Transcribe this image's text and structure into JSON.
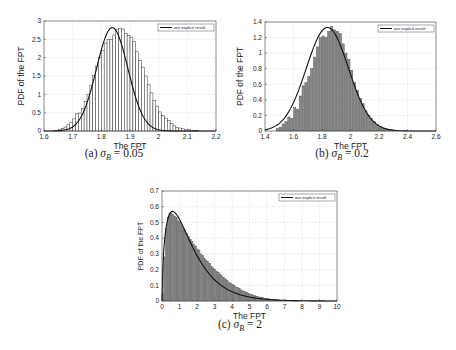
{
  "chart_data": [
    {
      "id": "a",
      "type": "bar",
      "subtype": "histogram-with-curve",
      "title": "",
      "caption": {
        "prefix": "(a) ",
        "symbol": "σ",
        "sub": "B",
        "suffix": " = 0.05"
      },
      "xlabel": "The FPT",
      "ylabel": "PDF of the FPT",
      "xlim": [
        1.6,
        2.2
      ],
      "ylim": [
        0,
        3
      ],
      "xticks": [
        1.6,
        1.7,
        1.8,
        1.9,
        2.0,
        2.1,
        2.2
      ],
      "xtick_labels": [
        "1.6",
        "1.7",
        "1.8",
        "1.9",
        "2",
        "2.1",
        "2.2"
      ],
      "yticks": [
        0,
        0.5,
        1,
        1.5,
        2,
        2.5,
        3
      ],
      "ytick_labels": [
        "0",
        "0.5",
        "1",
        "1.5",
        "2",
        "2.5",
        "3"
      ],
      "grid": true,
      "legend": {
        "position": "upper right",
        "entries": [
          "our explicit result"
        ]
      },
      "bar_style": "white",
      "bins": {
        "start": 1.64,
        "width": 0.01,
        "values": [
          0.02,
          0.04,
          0.07,
          0.11,
          0.17,
          0.24,
          0.33,
          0.47,
          0.49,
          0.62,
          0.8,
          1.0,
          1.25,
          1.52,
          1.77,
          2.0,
          2.2,
          2.4,
          2.5,
          2.5,
          2.62,
          2.76,
          2.8,
          2.78,
          2.66,
          2.6,
          2.56,
          2.44,
          2.16,
          1.92,
          1.74,
          1.5,
          1.26,
          1.04,
          0.84,
          0.68,
          0.52,
          0.42,
          0.35,
          0.28,
          0.2,
          0.14,
          0.1,
          0.08,
          0.06,
          0.03,
          0.05,
          0.02,
          0.01,
          0.01
        ]
      },
      "curve": {
        "kind": "gaussian",
        "mean": 1.838,
        "sd": 0.0545,
        "peak": 2.82,
        "label": "our explicit result"
      }
    },
    {
      "id": "b",
      "type": "bar",
      "subtype": "histogram-with-curve",
      "title": "",
      "caption": {
        "prefix": "(b) ",
        "symbol": "σ",
        "sub": "B",
        "suffix": " = 0.2"
      },
      "xlabel": "The FPT",
      "ylabel": "PDF of the FPT",
      "xlim": [
        1.4,
        2.6
      ],
      "ylim": [
        0,
        1.4
      ],
      "xticks": [
        1.4,
        1.6,
        1.8,
        2.0,
        2.2,
        2.4,
        2.6
      ],
      "xtick_labels": [
        "1.4",
        "1.6",
        "1.8",
        "2",
        "2.2",
        "2.4",
        "2.6"
      ],
      "yticks": [
        0,
        0.2,
        0.4,
        0.6,
        0.8,
        1.0,
        1.2,
        1.4
      ],
      "ytick_labels": [
        "0",
        "0.2",
        "0.4",
        "0.6",
        "0.8",
        "1",
        "1.2",
        "1.4"
      ],
      "grid": true,
      "legend": {
        "position": "upper right",
        "entries": [
          "our explicit result"
        ]
      },
      "bar_style": "gray",
      "bins": {
        "start": 1.48,
        "width": 0.02,
        "values": [
          0.03,
          0.05,
          0.09,
          0.12,
          0.18,
          0.16,
          0.3,
          0.28,
          0.45,
          0.58,
          0.62,
          0.7,
          0.8,
          0.95,
          1.08,
          1.2,
          1.22,
          1.2,
          1.28,
          1.34,
          1.3,
          1.28,
          1.25,
          1.12,
          1.0,
          0.92,
          0.78,
          0.62,
          0.52,
          0.42,
          0.35,
          0.26,
          0.2,
          0.16,
          0.12,
          0.08,
          0.06,
          0.04,
          0.03,
          0.02,
          0.02,
          0.01
        ]
      },
      "curve": {
        "kind": "gaussian",
        "mean": 1.838,
        "sd": 0.148,
        "peak": 1.33,
        "label": "our explicit result"
      }
    },
    {
      "id": "c",
      "type": "bar",
      "subtype": "histogram-with-curve",
      "title": "",
      "caption": {
        "prefix": "(c) ",
        "symbol": "σ",
        "sub": "B",
        "suffix": " = 2"
      },
      "xlabel": "The FPT",
      "ylabel": "PDF of the FPT",
      "xlim": [
        0,
        10
      ],
      "ylim": [
        0,
        0.7
      ],
      "xticks": [
        0,
        1,
        2,
        3,
        4,
        5,
        6,
        7,
        8,
        9,
        10
      ],
      "xtick_labels": [
        "0",
        "1",
        "2",
        "3",
        "4",
        "5",
        "6",
        "7",
        "8",
        "9",
        "10"
      ],
      "yticks": [
        0,
        0.1,
        0.2,
        0.3,
        0.4,
        0.5,
        0.6,
        0.7
      ],
      "ytick_labels": [
        "0",
        "0.1",
        "0.2",
        "0.3",
        "0.4",
        "0.5",
        "0.6",
        "0.7"
      ],
      "grid": true,
      "legend": {
        "position": "upper right",
        "entries": [
          "our explicit result"
        ]
      },
      "bar_style": "gray",
      "bins": {
        "start": 0.0,
        "width": 0.1,
        "values": [
          0.05,
          0.28,
          0.46,
          0.53,
          0.56,
          0.56,
          0.55,
          0.54,
          0.53,
          0.51,
          0.5,
          0.48,
          0.46,
          0.45,
          0.43,
          0.41,
          0.39,
          0.38,
          0.36,
          0.35,
          0.33,
          0.32,
          0.3,
          0.29,
          0.27,
          0.26,
          0.25,
          0.24,
          0.22,
          0.21,
          0.2,
          0.19,
          0.18,
          0.17,
          0.16,
          0.15,
          0.14,
          0.13,
          0.12,
          0.115,
          0.105,
          0.1,
          0.09,
          0.085,
          0.08,
          0.07,
          0.065,
          0.06,
          0.055,
          0.05,
          0.045,
          0.04,
          0.037,
          0.033,
          0.03,
          0.027,
          0.024,
          0.021,
          0.019,
          0.017,
          0.015,
          0.013,
          0.011,
          0.01,
          0.009,
          0.008,
          0.007,
          0.006,
          0.005,
          0.004,
          0.004,
          0.003,
          0.003,
          0.002,
          0.002,
          0.002,
          0.001,
          0.001,
          0.001,
          0.001
        ]
      },
      "curve": {
        "kind": "inverse-gaussian-like",
        "mode": 0.6,
        "peak": 0.57,
        "label": "our explicit result"
      }
    }
  ]
}
